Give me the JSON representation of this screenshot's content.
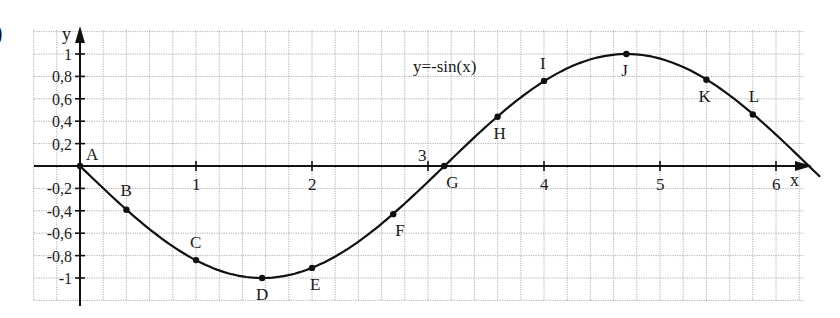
{
  "part_label": ")",
  "chart_data": {
    "type": "line",
    "function_label": "y=-sin(x)",
    "xlabel": "x",
    "ylabel": "y",
    "xlim": [
      -0.4,
      6.3
    ],
    "ylim": [
      -1.2,
      1.2
    ],
    "x_ticks": [
      1,
      2,
      3,
      4,
      5,
      6
    ],
    "x_tick_labels": [
      "1",
      "2",
      "3",
      "4",
      "5",
      "6"
    ],
    "y_ticks": [
      1,
      0.8,
      0.6,
      0.4,
      0.2,
      -0.2,
      -0.4,
      -0.6,
      -0.8,
      -1
    ],
    "y_tick_labels": [
      "1",
      "0,8",
      "0,6",
      "0,4",
      "0,2",
      "-0,2",
      "-0,4",
      "-0,6",
      "-0,8",
      "-1"
    ],
    "grid": true,
    "grid_step": {
      "x": 0.2,
      "y": 0.2
    },
    "points": [
      {
        "name": "A",
        "x": 0,
        "y": 0
      },
      {
        "name": "B",
        "x": 0.4,
        "y": -0.39
      },
      {
        "name": "C",
        "x": 1.0,
        "y": -0.84
      },
      {
        "name": "D",
        "x": 1.57,
        "y": -1.0
      },
      {
        "name": "E",
        "x": 2.0,
        "y": -0.91
      },
      {
        "name": "F",
        "x": 2.7,
        "y": -0.43
      },
      {
        "name": "G",
        "x": 3.14,
        "y": 0
      },
      {
        "name": "H",
        "x": 3.6,
        "y": 0.44
      },
      {
        "name": "I",
        "x": 4.0,
        "y": 0.76
      },
      {
        "name": "J",
        "x": 4.71,
        "y": 1.0
      },
      {
        "name": "K",
        "x": 5.4,
        "y": 0.77
      },
      {
        "name": "L",
        "x": 5.8,
        "y": 0.46
      }
    ],
    "series": [
      {
        "name": "y=-sin(x)",
        "x_range": [
          0,
          6.28
        ]
      }
    ]
  }
}
